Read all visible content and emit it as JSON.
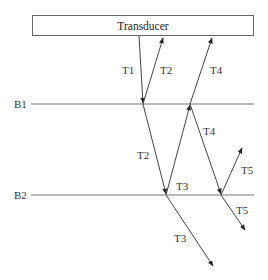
{
  "transducer": {
    "label": "Transducer",
    "box": {
      "x": 32,
      "y": 15,
      "w": 222,
      "h": 21
    }
  },
  "boundaries": [
    {
      "id": "B1",
      "label": "B1",
      "y": 104,
      "x1": 31,
      "x2": 254
    },
    {
      "id": "B2",
      "label": "B2",
      "y": 195,
      "x1": 31,
      "x2": 254
    }
  ],
  "rays": [
    {
      "id": "T1",
      "label": "T1",
      "from": [
        139,
        36
      ],
      "to": [
        143,
        103
      ]
    },
    {
      "id": "T2-up",
      "label": "T2",
      "from": [
        143,
        104
      ],
      "to": [
        163,
        38
      ]
    },
    {
      "id": "T2-down",
      "label": "T2",
      "from": [
        143,
        104
      ],
      "to": [
        166,
        194
      ]
    },
    {
      "id": "T3-up",
      "label": "T3",
      "from": [
        166,
        195
      ],
      "to": [
        190,
        105
      ]
    },
    {
      "id": "T4-up",
      "label": "T4",
      "from": [
        190,
        104
      ],
      "to": [
        212,
        38
      ]
    },
    {
      "id": "T4-down",
      "label": "T4",
      "from": [
        190,
        104
      ],
      "to": [
        221,
        194
      ]
    },
    {
      "id": "T3-down",
      "label": "T3",
      "from": [
        166,
        195
      ],
      "to": [
        213,
        266
      ]
    },
    {
      "id": "T5-up",
      "label": "T5",
      "from": [
        221,
        195
      ],
      "to": [
        242,
        148
      ]
    },
    {
      "id": "T5-down",
      "label": "T5",
      "from": [
        221,
        195
      ],
      "to": [
        245,
        230
      ]
    }
  ],
  "labels": {
    "T1": "T1",
    "T2_upper": "T2",
    "T4_upper": "T4",
    "T4_lower": "T4",
    "T2_lower": "T2",
    "T3_upper": "T3",
    "T5_upper": "T5",
    "T5_lower": "T5",
    "T3_lower": "T3",
    "B1": "B1",
    "B2": "B2"
  }
}
